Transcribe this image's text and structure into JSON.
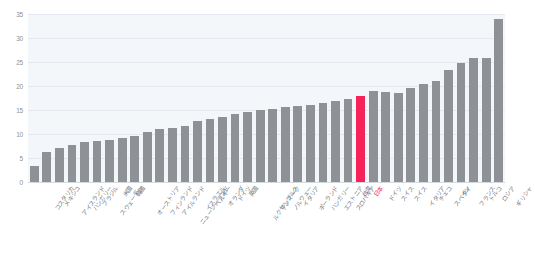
{
  "chart_data": {
    "type": "bar",
    "title": "",
    "subtitle": "",
    "xlabel": "",
    "ylabel": "",
    "ylim": [
      0,
      35
    ],
    "grid": true,
    "legend": null,
    "yticks": [
      0,
      5,
      10,
      15,
      20,
      25,
      30,
      35
    ],
    "highlight_category": "日本",
    "colors": {
      "bar": "#8e9296",
      "highlight": "#f5235a",
      "plot_background": "#f4f7f9",
      "gridline": "#e3e9ee",
      "tick_text": "#8a9199",
      "label_text": "#6f767d"
    },
    "categories": [
      "コスタリカ",
      "メキシコ",
      "アイスランド",
      "ハンガリー",
      "ブラジル",
      "スウェーデン",
      "米国",
      "韓国",
      "オーストリア",
      "フィンランド",
      "アイルランド",
      "ニュージーランド",
      "イスラエル",
      "ベルギー",
      "オランダ",
      "ドイツ",
      "英国",
      "ルクセンブルク",
      "デンマーク",
      "ノルウェー",
      "イタリア",
      "ポーランド",
      "ハンガリー",
      "エストニア",
      "スロバキア",
      "台湾",
      "日本",
      "ドイツ",
      "スイス",
      "スイス",
      "イタリア",
      "チェコ",
      "スペイン",
      "タイ",
      "フランス",
      "トルコ",
      "ロシア",
      "ギリシャ"
    ],
    "values": [
      3.3,
      6.3,
      7.0,
      7.8,
      8.4,
      8.6,
      8.7,
      9.2,
      9.6,
      10.4,
      11.1,
      11.3,
      11.6,
      12.8,
      13.2,
      13.5,
      14.2,
      14.6,
      15.1,
      15.3,
      15.6,
      15.8,
      16.0,
      16.4,
      16.8,
      17.2,
      18.0,
      19.0,
      18.7,
      18.6,
      19.6,
      20.5,
      21.0,
      23.4,
      24.8,
      25.8,
      25.9,
      34.0
    ]
  }
}
